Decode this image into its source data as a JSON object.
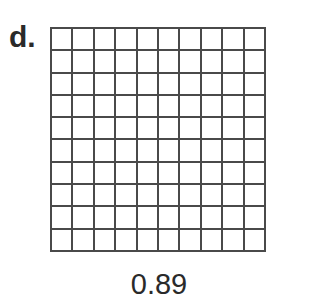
{
  "problem": {
    "label": "d.",
    "value": "0.89",
    "grid": {
      "rows": 10,
      "cols": 10,
      "shaded": 0
    }
  }
}
